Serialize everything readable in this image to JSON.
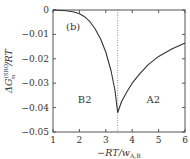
{
  "chart_data": {
    "type": "line",
    "title": "",
    "panel_label": "(b)",
    "xlabel": "−RT/w_{A,B}",
    "ylabel": "ΔG_m^{(SRO)}/RT",
    "xlim": [
      1,
      6
    ],
    "ylim": [
      -0.05,
      0
    ],
    "xticks": [
      1,
      2,
      3,
      4,
      5,
      6
    ],
    "xtick_labels": [
      "1",
      "2",
      "3",
      "4",
      "5",
      "6"
    ],
    "yticks": [
      0,
      -0.01,
      -0.02,
      -0.03,
      -0.04,
      -0.05
    ],
    "ytick_labels": [
      "0",
      "−0.01",
      "−0.02",
      "−0.03",
      "−0.04",
      "−0.05"
    ],
    "grid": false,
    "vline": {
      "x": 3.45,
      "style": "dotted"
    },
    "annotations": [
      {
        "text": "B2",
        "x": 2.2,
        "y": -0.037
      },
      {
        "text": "A2",
        "x": 4.8,
        "y": -0.037
      }
    ],
    "series": [
      {
        "name": "B2 branch",
        "x": [
          1.0,
          1.5,
          1.8,
          2.0,
          2.2,
          2.4,
          2.6,
          2.8,
          3.0,
          3.2,
          3.35,
          3.45
        ],
        "y": [
          0.0,
          -0.0003,
          -0.0008,
          -0.0015,
          -0.0028,
          -0.0048,
          -0.0078,
          -0.0118,
          -0.0172,
          -0.025,
          -0.033,
          -0.042
        ]
      },
      {
        "name": "A2 branch",
        "x": [
          3.45,
          3.6,
          3.8,
          4.0,
          4.3,
          4.6,
          5.0,
          5.5,
          6.0
        ],
        "y": [
          -0.042,
          -0.0375,
          -0.0335,
          -0.03,
          -0.026,
          -0.0225,
          -0.019,
          -0.016,
          -0.0135
        ]
      }
    ]
  }
}
